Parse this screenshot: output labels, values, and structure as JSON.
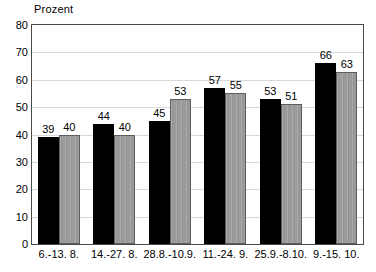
{
  "chart_data": {
    "type": "bar",
    "title": "",
    "ylabel": "Prozent",
    "xlabel": "",
    "ylim": [
      0,
      80
    ],
    "y_ticks": [
      0,
      10,
      20,
      30,
      40,
      50,
      60,
      70,
      80
    ],
    "y_tick_labels": [
      "0",
      "10",
      "20",
      "30",
      "40",
      "50",
      "60",
      "70",
      "80"
    ],
    "grid": true,
    "grid_axis": "y",
    "legend": false,
    "legend_position": "none",
    "categories": [
      "6.-13. 8.",
      "14.-27. 8.",
      "28.8.-10.9.",
      "11.-24. 9.",
      "25.9.-8.10.",
      "9.-15. 10."
    ],
    "series": [
      {
        "name": "series-1",
        "color": "#000000",
        "values": [
          39,
          44,
          45,
          57,
          53,
          66
        ],
        "value_labels": [
          "39",
          "44",
          "45",
          "57",
          "53",
          "66"
        ]
      },
      {
        "name": "series-2",
        "color": "#9b9b9b",
        "values": [
          40,
          40,
          53,
          55,
          51,
          63
        ],
        "value_labels": [
          "40",
          "40",
          "53",
          "55",
          "51",
          "63"
        ]
      }
    ]
  },
  "colors": {
    "series_dark": "#000000",
    "series_light": "#9b9b9b",
    "series_light_outline": "#5d5d5d",
    "frame": "#4a4a4a",
    "gridline": "#d8d8d8",
    "background": "#ffffff",
    "text": "#000000"
  }
}
